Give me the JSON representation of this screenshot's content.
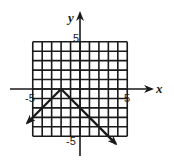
{
  "chart_data": {
    "type": "line",
    "title": "",
    "xlabel": "x",
    "ylabel": "y",
    "xlim": [
      -5,
      5
    ],
    "ylim": [
      -5,
      5
    ],
    "grid": true,
    "grid_step": 1,
    "tick_labels": {
      "x_min": "-5",
      "x_max": "5",
      "y_max": "5",
      "y_min": "-5"
    },
    "series": [
      {
        "name": "y = -|x + 2|",
        "vertex": [
          -2,
          0
        ],
        "points": [
          [
            -5.6,
            -3.6
          ],
          [
            -2,
            0
          ],
          [
            3.8,
            -5.8
          ]
        ],
        "arrows_at_ends": true
      }
    ],
    "colors": {
      "grid": "#1a1a1a",
      "axis": "#1a1a1a",
      "line": "#1a1a1a"
    }
  }
}
